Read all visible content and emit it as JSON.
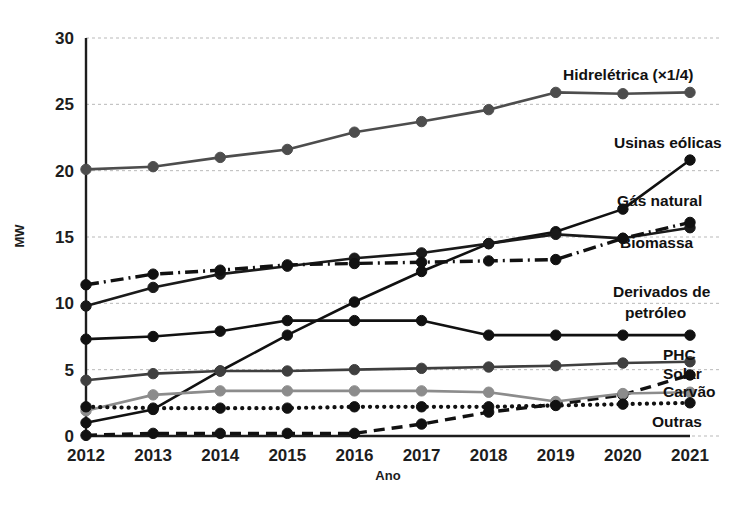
{
  "chart_data": {
    "type": "line",
    "title": "",
    "xlabel": "Ano",
    "ylabel": "MW",
    "categories": [
      "2012",
      "2013",
      "2014",
      "2015",
      "2016",
      "2017",
      "2018",
      "2019",
      "2020",
      "2021"
    ],
    "x": [
      2012,
      2013,
      2014,
      2015,
      2016,
      2017,
      2018,
      2019,
      2020,
      2021
    ],
    "xlim": [
      2012,
      2021
    ],
    "ylim": [
      0,
      30
    ],
    "yticks": [
      0,
      5,
      10,
      15,
      20,
      25,
      30
    ],
    "xticks": [
      "2012",
      "2013",
      "2014",
      "2015",
      "2016",
      "2017",
      "2018",
      "2019",
      "2020",
      "2021"
    ],
    "grid": "horizontal",
    "legend_position": "right-inline-labels",
    "series": [
      {
        "name": "Hidrelétrica (×1/4)",
        "label": "Hidrelétrica (×1/4)",
        "color": "#4d4d4d",
        "style": "solid",
        "values": [
          20.1,
          20.3,
          21.0,
          21.6,
          22.9,
          23.7,
          24.6,
          25.9,
          25.8,
          25.9
        ]
      },
      {
        "name": "Usinas eólicas",
        "label": "Usinas eólicas",
        "color": "#111111",
        "style": "solid",
        "values": [
          1.0,
          2.0,
          4.9,
          7.6,
          10.1,
          12.4,
          14.5,
          15.4,
          17.1,
          20.8
        ]
      },
      {
        "name": "Gás natural",
        "label": "Gás natural",
        "color": "#1a1a1a",
        "style": "solid",
        "values": [
          9.8,
          11.2,
          12.2,
          12.8,
          13.4,
          13.8,
          14.5,
          15.2,
          14.9,
          15.7
        ]
      },
      {
        "name": "Biomassa",
        "label": "Biomassa",
        "color": "#111111",
        "style": "dashdot",
        "values": [
          11.4,
          12.2,
          12.5,
          12.9,
          13.0,
          13.1,
          13.2,
          13.3,
          14.9,
          16.1
        ]
      },
      {
        "name": "Derivados de petróleo",
        "label": "Derivados de petróleo",
        "color": "#111111",
        "style": "solid",
        "values": [
          7.3,
          7.5,
          7.9,
          8.7,
          8.7,
          8.7,
          7.6,
          7.6,
          7.6,
          7.6
        ]
      },
      {
        "name": "PHC",
        "label": "PHC",
        "color": "#3f3f3f",
        "style": "solid",
        "values": [
          4.2,
          4.7,
          4.9,
          4.9,
          5.0,
          5.1,
          5.2,
          5.3,
          5.5,
          5.6
        ]
      },
      {
        "name": "Solar",
        "label": "Solar",
        "color": "#111111",
        "style": "dashed",
        "values": [
          0.05,
          0.2,
          0.2,
          0.2,
          0.2,
          0.9,
          1.8,
          2.4,
          3.1,
          4.6
        ]
      },
      {
        "name": "Carvão",
        "label": "Carvão",
        "color": "#8c8c8c",
        "style": "solid",
        "values": [
          1.9,
          3.1,
          3.4,
          3.4,
          3.4,
          3.4,
          3.3,
          2.6,
          3.2,
          3.3
        ]
      },
      {
        "name": "Outras",
        "label": "Outras",
        "color": "#111111",
        "style": "dotted",
        "values": [
          2.2,
          2.1,
          2.1,
          2.1,
          2.2,
          2.2,
          2.2,
          2.3,
          2.4,
          2.5
        ]
      }
    ],
    "annotations": [
      {
        "text": "Hidrelétrica (×1/4)",
        "for": "Hidrelétrica (×1/4)"
      },
      {
        "text": "Usinas eólicas",
        "for": "Usinas eólicas"
      },
      {
        "text": "Gás natural",
        "for": "Gás natural"
      },
      {
        "text": "Biomassa",
        "for": "Biomassa"
      },
      {
        "text": "Derivados de",
        "for": "Derivados de petróleo"
      },
      {
        "text": "petróleo",
        "for": "Derivados de petróleo"
      },
      {
        "text": "PHC",
        "for": "PHC"
      },
      {
        "text": "Solar",
        "for": "Solar"
      },
      {
        "text": "Carvão",
        "for": "Carvão"
      },
      {
        "text": "Outras",
        "for": "Outras"
      }
    ]
  },
  "labels": {
    "hidreletrica": "Hidrelétrica (×1/4)",
    "usinas_eolicas": "Usinas eólicas",
    "gas_natural": "Gás natural",
    "biomassa": "Biomassa",
    "derivados_line1": "Derivados de",
    "derivados_line2": "petróleo",
    "phc": "PHC",
    "solar": "Solar",
    "carvao": "Carvão",
    "outras": "Outras",
    "x_axis_title": "Ano",
    "y_axis_title": "MW"
  },
  "axis": {
    "y_ticks": [
      "30",
      "25",
      "20",
      "15",
      "10",
      "5",
      "0"
    ],
    "x_ticks": [
      "2012",
      "2013",
      "2014",
      "2015",
      "2016",
      "2017",
      "2018",
      "2019",
      "2020",
      "2021"
    ]
  }
}
